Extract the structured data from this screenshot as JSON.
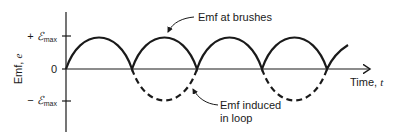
{
  "diagram": {
    "y_axis_label": "Emf, ",
    "y_axis_label_var": "e",
    "x_axis_label": "Time, ",
    "x_axis_label_var": "t",
    "ticks": {
      "plus_max_sign": "+ ",
      "plus_max_symbol": "ℰ",
      "plus_max_sub": "max",
      "zero": "0",
      "minus_max_sign": "− ",
      "minus_max_symbol": "ℰ",
      "minus_max_sub": "max"
    },
    "annotations": {
      "brushes": "Emf at brushes",
      "loop_line1": "Emf induced",
      "loop_line2": "in loop"
    },
    "colors": {
      "ink": "#1a1a1a",
      "background": "#ffffff"
    }
  }
}
